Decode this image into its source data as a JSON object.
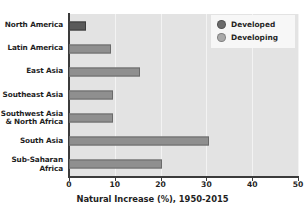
{
  "chart_data": {
    "type": "bar",
    "orientation": "horizontal",
    "title": "",
    "xlabel": "Natural Increase (%), 1950-2015",
    "ylabel": "",
    "xlim": [
      0,
      50
    ],
    "xticks": [
      0,
      10,
      20,
      30,
      40,
      50
    ],
    "xtick_labels": [
      "0",
      "10",
      "20",
      "30",
      "40",
      "50"
    ],
    "grid": true,
    "grid_axis": "x",
    "legend_position": "top-right",
    "legend": [
      {
        "name": "Developed",
        "color": "#6b6b6b"
      },
      {
        "name": "Developing",
        "color": "#aaaaaa"
      }
    ],
    "categories": [
      "North America",
      "Latin America",
      "East Asia",
      "Southeast Asia",
      "Southwest Asia\n& North Africa",
      "South Asia",
      "Sub-Saharan Africa"
    ],
    "values": [
      3.7,
      9.2,
      15.5,
      9.7,
      9.5,
      30.5,
      20.3
    ],
    "groups": [
      "Developed",
      "Developing",
      "Developing",
      "Developing",
      "Developing",
      "Developing",
      "Developing"
    ],
    "bars": [
      {
        "label": "North America",
        "value": 3.7,
        "group": "Developed"
      },
      {
        "label": "Latin America",
        "value": 9.2,
        "group": "Developing"
      },
      {
        "label": "East Asia",
        "value": 15.5,
        "group": "Developing"
      },
      {
        "label": "Southeast Asia",
        "value": 9.7,
        "group": "Developing"
      },
      {
        "label": "Southwest Asia\n& North Africa",
        "value": 9.5,
        "group": "Developing"
      },
      {
        "label": "South Asia",
        "value": 30.5,
        "group": "Developing"
      },
      {
        "label": "Sub-Saharan Africa",
        "value": 20.3,
        "group": "Developing"
      }
    ],
    "colors": {
      "developed": "#5a5a5a",
      "developing": "#8f8f8f",
      "plot_background": "#e3e3e3",
      "gridline": "#f3f3f3",
      "axis": "#3b3b3b",
      "text": "#1f1f1f",
      "legend_background": "#f7f7f7"
    }
  }
}
